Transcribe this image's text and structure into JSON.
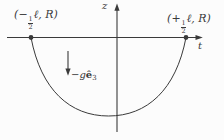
{
  "figure": {
    "colors": {
      "ink": "#3a3a3a",
      "background": "#fcfcfc"
    },
    "axes": {
      "z_label": "z",
      "t_label": "t"
    },
    "left_point": {
      "prefix": "(−",
      "frac_num": "1",
      "frac_den": "2",
      "suffix": "ℓ, R)"
    },
    "right_point": {
      "prefix": "(+",
      "frac_num": "1",
      "frac_den": "2",
      "suffix": "ℓ, R)"
    },
    "gravity": {
      "prefix": "−g",
      "vector": "ê",
      "subscript": "3"
    }
  }
}
